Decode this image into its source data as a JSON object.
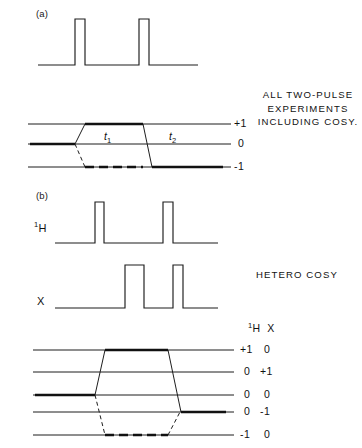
{
  "figure": {
    "background_color": "#ffffff",
    "ink_color": "#111111",
    "width": 362,
    "height": 448
  },
  "panels": [
    {
      "tag": "(a)",
      "tag_x": 36,
      "tag_y": 14,
      "annotation": {
        "lines": [
          "ALL TWO-PULSE",
          "EXPERIMENTS",
          "INCLUDING  COSY."
        ],
        "x": 256,
        "y": 88,
        "width": 104
      },
      "pulse_sequences": [
        {
          "name": "single-channel",
          "channel_label": "",
          "baseline_y": 65,
          "baseline_x0": 38,
          "baseline_x1": 198,
          "pulse_top_y": 19,
          "pulses": [
            {
              "x0": 75,
              "x1": 85
            },
            {
              "x0": 139,
              "x1": 149
            }
          ]
        }
      ],
      "coherence_diagram": {
        "levels": [
          {
            "label": "+1",
            "order": 1,
            "y": 124
          },
          {
            "label": "0",
            "order": 0,
            "y": 144
          },
          {
            "label": "-1",
            "order": -1,
            "y": 167
          }
        ],
        "line_x0": 28,
        "line_x1": 225,
        "label_x": 232,
        "pulse_x": [
          75,
          143
        ],
        "time_labels": [
          {
            "text": "t",
            "sub": "1",
            "x": 110,
            "y": 137
          },
          {
            "text": "t",
            "sub": "2",
            "x": 175,
            "y": 137
          }
        ],
        "pathways": [
          {
            "style": "solid-bold",
            "points": [
              [
                28,
                144
              ],
              [
                75,
                144
              ],
              [
                85,
                124
              ],
              [
                143,
                124
              ],
              [
                152,
                167
              ],
              [
                225,
                167
              ]
            ]
          },
          {
            "style": "dashed-bold",
            "points": [
              [
                28,
                144
              ],
              [
                75,
                144
              ],
              [
                85,
                167
              ],
              [
                143,
                167
              ]
            ]
          }
        ]
      }
    },
    {
      "tag": "(b)",
      "tag_x": 36,
      "tag_y": 195,
      "annotation": {
        "lines": [
          "HETERO COSY"
        ],
        "x": 256,
        "y": 268,
        "width": 104
      },
      "pulse_sequences": [
        {
          "name": "proton-channel",
          "channel_label": "1H",
          "channel_label_sup": "1",
          "channel_label_main": "H",
          "label_x": 36,
          "label_y": 222,
          "baseline_y": 243,
          "baseline_x0": 55,
          "baseline_x1": 218,
          "pulse_top_y": 202,
          "pulses": [
            {
              "x0": 95,
              "x1": 104
            },
            {
              "x0": 163,
              "x1": 173
            }
          ]
        },
        {
          "name": "x-channel",
          "channel_label": "X",
          "channel_label_sup": "",
          "channel_label_main": "X",
          "label_x": 37,
          "label_y": 294,
          "baseline_y": 308,
          "baseline_x0": 55,
          "baseline_x1": 218,
          "pulse_top_y": 265,
          "pulses": [
            {
              "x0": 125,
              "x1": 144
            },
            {
              "x0": 173,
              "x1": 183
            }
          ]
        }
      ],
      "coherence_diagram": {
        "column_header": {
          "proton": "1H",
          "x": "X",
          "pos_x": 248,
          "pos_y": 322
        },
        "levels": [
          {
            "label_proton": "+1",
            "label_x": "0",
            "y": 350
          },
          {
            "label_proton": "0",
            "label_x": "+1",
            "y": 372
          },
          {
            "label_proton": "0",
            "label_x": "0",
            "y": 395
          },
          {
            "label_proton": "0",
            "label_x": "-1",
            "y": 412
          },
          {
            "label_proton": "-1",
            "label_x": "0",
            "y": 435
          }
        ],
        "line_x0": 33,
        "line_x1": 228,
        "label_x": 238,
        "label_x2": 262,
        "pathways": [
          {
            "style": "solid-bold",
            "points": [
              [
                33,
                395
              ],
              [
                95,
                395
              ],
              [
                105,
                350
              ],
              [
                168,
                350
              ],
              [
                180,
                412
              ],
              [
                228,
                412
              ]
            ]
          },
          {
            "style": "dashed-bold",
            "points": [
              [
                33,
                395
              ],
              [
                95,
                395
              ],
              [
                105,
                435
              ],
              [
                168,
                435
              ],
              [
                180,
                412
              ]
            ]
          }
        ]
      }
    }
  ]
}
